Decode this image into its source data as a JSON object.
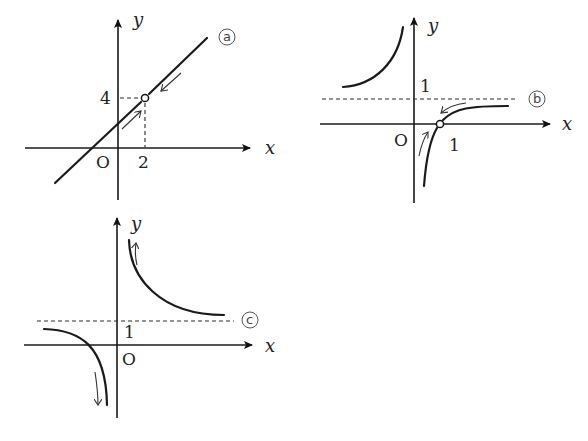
{
  "graphs": [
    {
      "id": "a",
      "marker": "a",
      "description": "Linear function with a hole at (2, 4)",
      "axis_labels": {
        "x": "x",
        "y": "y",
        "origin": "O"
      },
      "tick_labels": {
        "x_tick": "2",
        "y_tick": "4"
      },
      "hole_point": [
        2,
        4
      ]
    },
    {
      "id": "b",
      "marker": "b",
      "description": "Rational function with vertical asymptote x=0 and horizontal asymptote y=1, hole at (1, 0)",
      "axis_labels": {
        "x": "x",
        "y": "y",
        "origin": "O"
      },
      "tick_labels": {
        "x_tick": "1",
        "y_tick": "1"
      },
      "asymptote_y": 1,
      "hole_point": [
        1,
        0
      ]
    },
    {
      "id": "c",
      "marker": "c",
      "description": "Rational function with vertical asymptote x=0 and horizontal asymptote y=1",
      "axis_labels": {
        "x": "x",
        "y": "y",
        "origin": "O"
      },
      "tick_labels": {
        "y_tick": "1"
      },
      "asymptote_y": 1
    }
  ],
  "markers": {
    "a": "a",
    "b": "b",
    "c": "c"
  }
}
